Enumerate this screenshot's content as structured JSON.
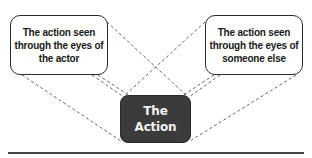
{
  "diagram": {
    "left_box": {
      "lines": [
        "The action seen",
        "through the eyes of",
        "the actor"
      ]
    },
    "right_box": {
      "lines": [
        "The action seen",
        "through the eyes of",
        "someone else"
      ]
    },
    "center_box": {
      "lines": [
        "The",
        "Action"
      ],
      "fill_color": "#3b3b3b",
      "text_color": "#f2f2f2"
    },
    "connector_style": "dashed",
    "connector_color": "#555555"
  }
}
